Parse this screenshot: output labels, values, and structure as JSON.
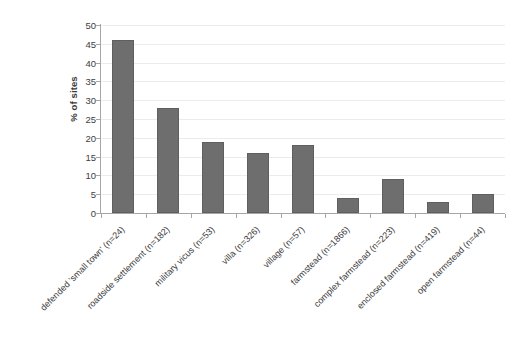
{
  "chart_data": {
    "type": "bar",
    "title": "",
    "xlabel": "",
    "ylabel": "% of sites",
    "ylim": [
      0,
      50
    ],
    "ytick_step": 5,
    "yticks": [
      0,
      5,
      10,
      15,
      20,
      25,
      30,
      35,
      40,
      45,
      50
    ],
    "grid": true,
    "legend": "none",
    "bar_color": "#6e6e6e",
    "categories": [
      "defended 'small town' (n=24)",
      "roadside settlement (n=182)",
      "military vicus (n=53)",
      "villa (n=326)",
      "village (n=57)",
      "farmstead (n=1866)",
      "complex farmstead (n=223)",
      "enclosed farmstead (n=419)",
      "open farmstead (n=44)"
    ],
    "values": [
      46,
      28,
      19,
      16,
      18,
      4,
      9,
      3,
      5
    ]
  }
}
